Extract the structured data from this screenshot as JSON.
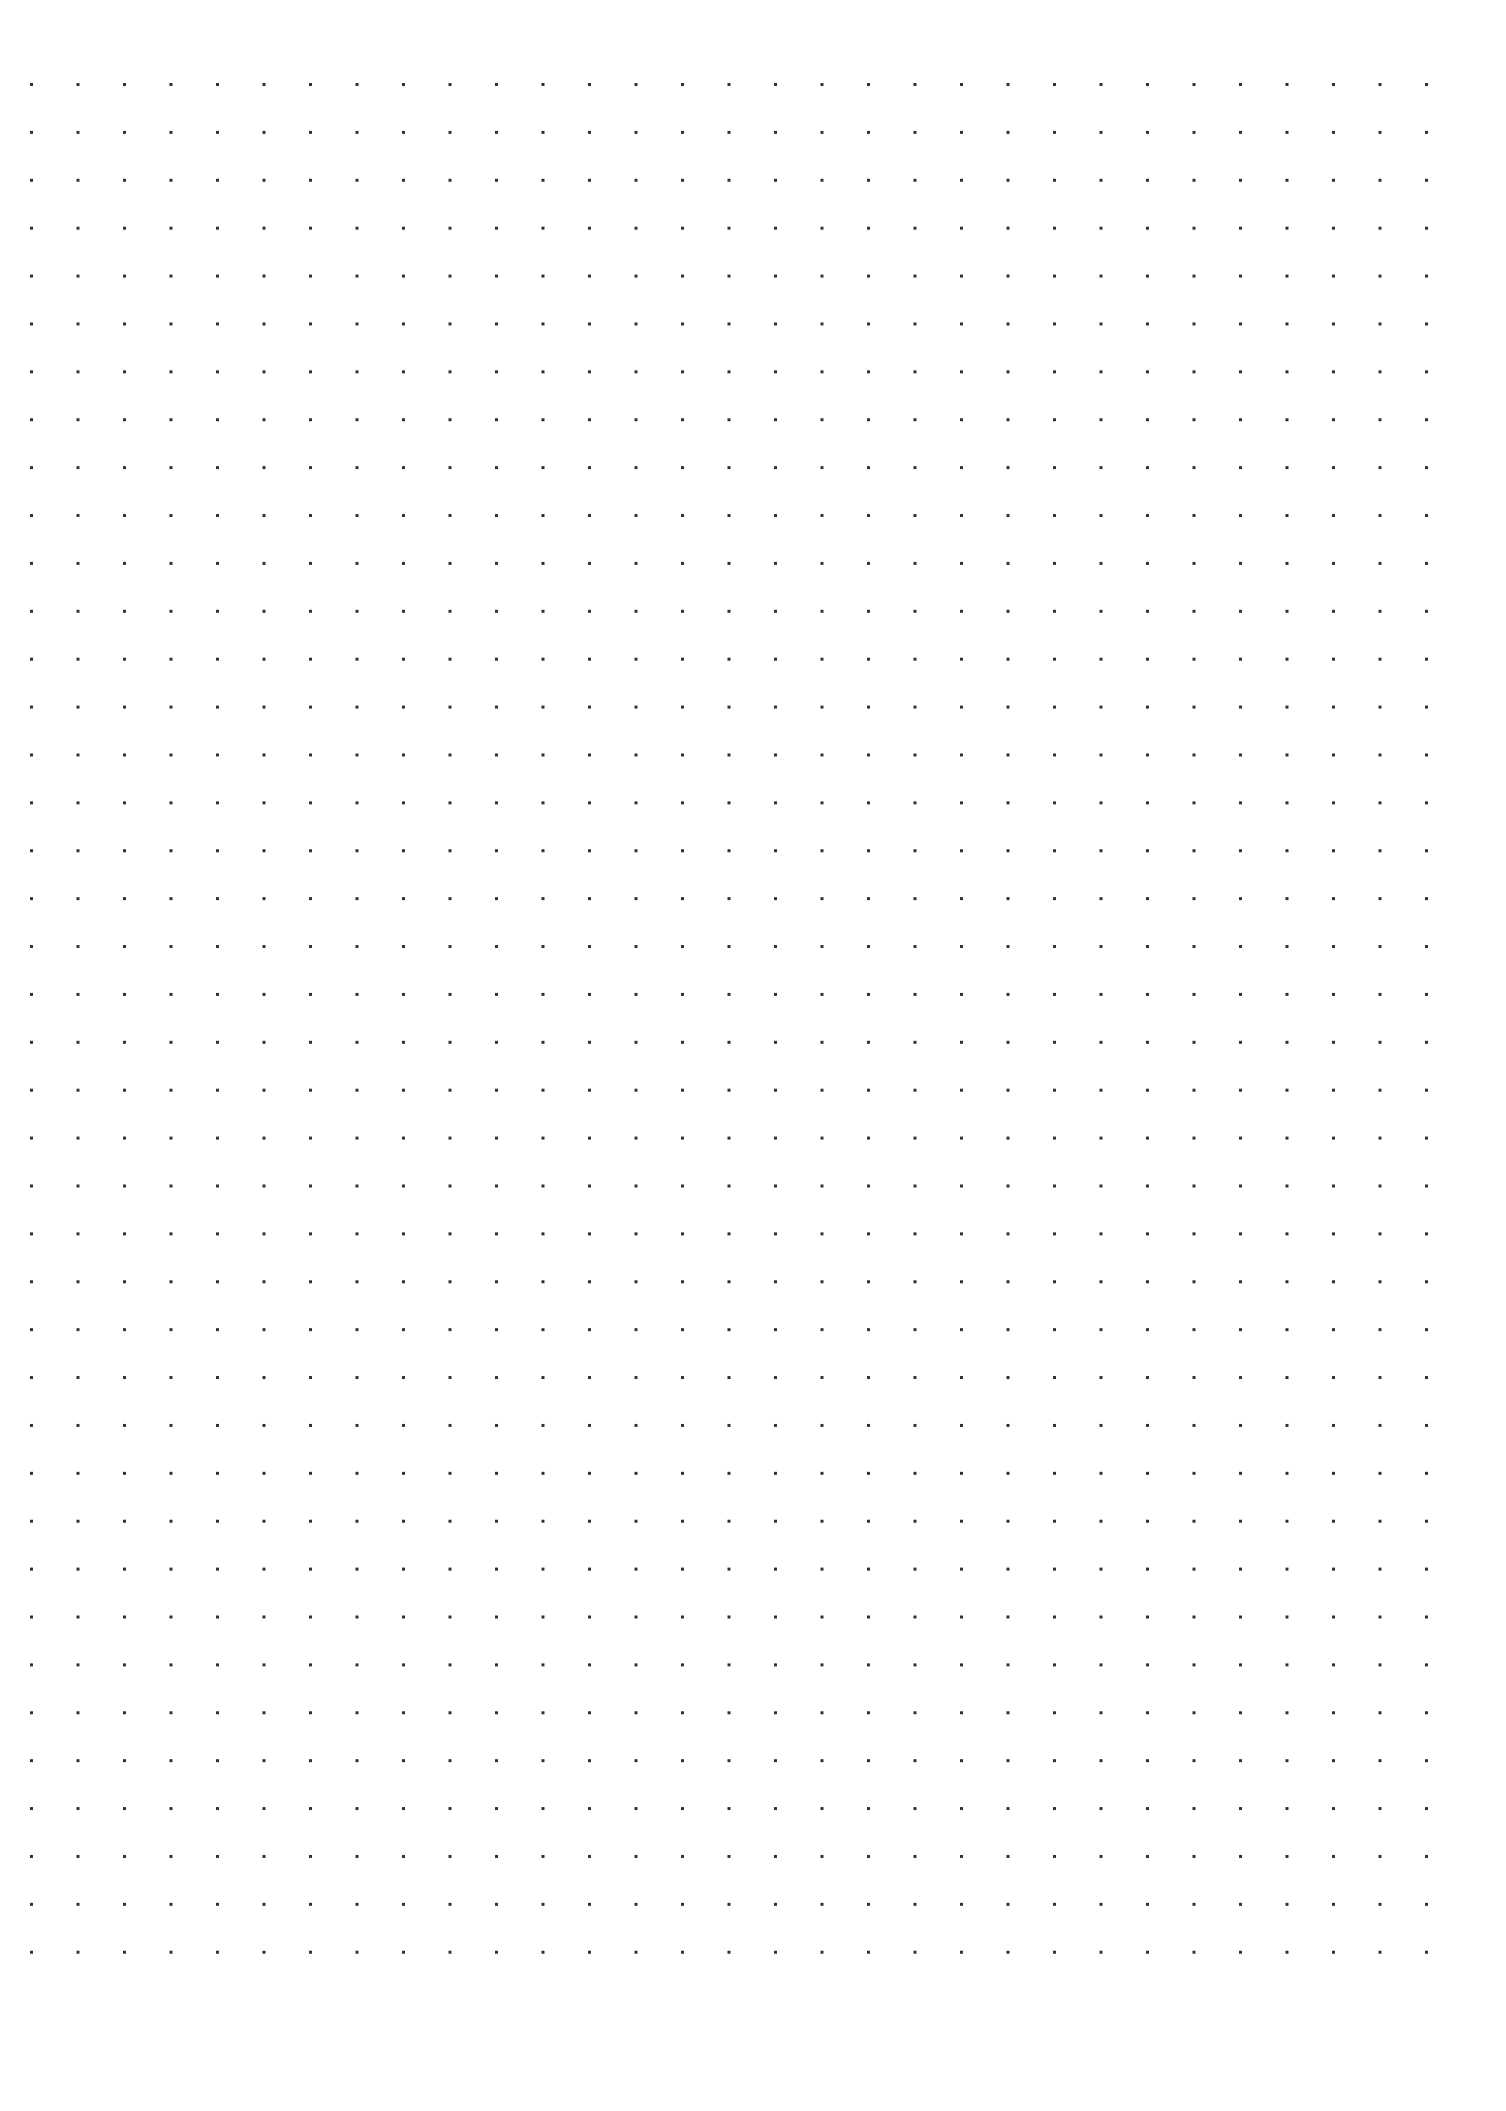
{
  "page": {
    "type": "dot-grid-paper",
    "background_color": "#ffffff",
    "dot_color": "#2e2e2e",
    "grid": {
      "columns": 31,
      "rows": 40,
      "first_dot": {
        "x": 31,
        "y": 84
      },
      "last_dot": {
        "x": 1426,
        "y": 1952
      },
      "spacing_x": 46.5,
      "spacing_y": 47.9,
      "dot_diameter": 3
    }
  }
}
